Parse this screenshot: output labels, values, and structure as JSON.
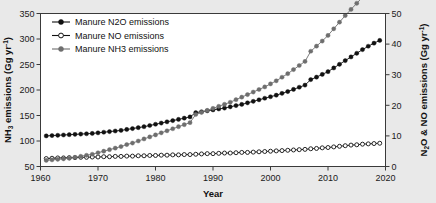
{
  "chart_data": {
    "type": "line",
    "title": "",
    "xlabel": "Year",
    "ylabel_left": "NH3 emissions (Gg yr-1)",
    "ylabel_right": "N2O & NO emissions (Gg yr-1)",
    "grid": false,
    "legend_position": "top-left",
    "xlim": [
      1960,
      2020
    ],
    "ylim_left": [
      50,
      350
    ],
    "ylim_right": [
      0,
      50
    ],
    "xticks": [
      1960,
      1970,
      1980,
      1990,
      2000,
      2010,
      2020
    ],
    "yticks_left": [
      50,
      100,
      150,
      200,
      250,
      300,
      350
    ],
    "yticks_right": [
      0,
      10,
      20,
      30,
      40,
      50
    ],
    "x": [
      1961,
      1962,
      1963,
      1964,
      1965,
      1966,
      1967,
      1968,
      1969,
      1970,
      1971,
      1972,
      1973,
      1974,
      1975,
      1976,
      1977,
      1978,
      1979,
      1980,
      1981,
      1982,
      1983,
      1984,
      1985,
      1986,
      1987,
      1988,
      1989,
      1990,
      1991,
      1992,
      1993,
      1994,
      1995,
      1996,
      1997,
      1998,
      1999,
      2000,
      2001,
      2002,
      2003,
      2004,
      2005,
      2006,
      2007,
      2008,
      2009,
      2010,
      2011,
      2012,
      2013,
      2014,
      2015,
      2016,
      2017,
      2018,
      2019
    ],
    "series": [
      {
        "name": "Manure N2O emissions",
        "axis": "right",
        "marker": "filled-circle",
        "color": "#111111",
        "values": [
          10.0,
          10.1,
          10.2,
          10.3,
          10.4,
          10.5,
          10.6,
          10.7,
          10.8,
          11.0,
          11.2,
          11.4,
          11.6,
          11.8,
          12.1,
          12.4,
          12.7,
          13.0,
          13.4,
          13.8,
          14.2,
          14.6,
          15.0,
          15.4,
          15.8,
          16.2,
          17.6,
          17.9,
          18.2,
          18.5,
          18.8,
          19.1,
          19.5,
          19.9,
          20.3,
          20.8,
          21.3,
          21.8,
          22.3,
          22.8,
          23.3,
          23.9,
          24.5,
          25.2,
          25.9,
          26.6,
          28.4,
          29.2,
          30.1,
          31.0,
          32.2,
          33.4,
          34.6,
          35.8,
          37.0,
          38.2,
          39.3,
          40.3,
          41.2
        ]
      },
      {
        "name": "Manure NO emissions",
        "axis": "right",
        "marker": "open-circle",
        "color": "#111111",
        "values": [
          2.6,
          2.7,
          2.8,
          2.8,
          2.9,
          2.9,
          3.0,
          3.0,
          3.1,
          3.1,
          3.2,
          3.2,
          3.3,
          3.3,
          3.4,
          3.4,
          3.5,
          3.5,
          3.6,
          3.6,
          3.7,
          3.7,
          3.8,
          3.8,
          3.9,
          3.9,
          4.0,
          4.1,
          4.2,
          4.2,
          4.3,
          4.4,
          4.4,
          4.5,
          4.6,
          4.6,
          4.7,
          4.8,
          4.9,
          5.0,
          5.1,
          5.2,
          5.3,
          5.4,
          5.5,
          5.6,
          5.8,
          5.9,
          6.1,
          6.2,
          6.4,
          6.6,
          6.8,
          7.0,
          7.1,
          7.3,
          7.4,
          7.5,
          7.6
        ]
      },
      {
        "name": "Manure NH3 emissions",
        "axis": "left",
        "marker": "filled-circle-gray",
        "color": "#6e6e6e",
        "values": [
          62,
          63,
          64,
          65,
          66,
          68,
          70,
          72,
          74,
          77,
          80,
          83,
          86,
          89,
          93,
          96,
          100,
          104,
          108,
          112,
          116,
          120,
          124,
          128,
          132,
          136,
          152,
          156,
          160,
          164,
          168,
          172,
          176,
          181,
          186,
          191,
          196,
          201,
          206,
          212,
          218,
          225,
          232,
          240,
          248,
          256,
          276,
          286,
          296,
          307,
          320,
          333,
          346,
          358,
          370,
          382,
          395,
          408,
          420
        ]
      }
    ]
  },
  "legend": {
    "items": [
      {
        "label": "Manure N2O emissions"
      },
      {
        "label": "Manure NO emissions"
      },
      {
        "label": "Manure NH3 emissions"
      }
    ]
  },
  "axes": {
    "x_title": "Year",
    "left_title_parts": {
      "pre": "NH",
      "sub": "3",
      "mid": " emissions (Gg yr",
      "sup": "-1",
      "post": ")"
    },
    "right_title_parts": {
      "pre": "N",
      "sub": "2",
      "mid": "O & NO emissions (Gg yr",
      "sup": "-1",
      "post": ")"
    }
  }
}
